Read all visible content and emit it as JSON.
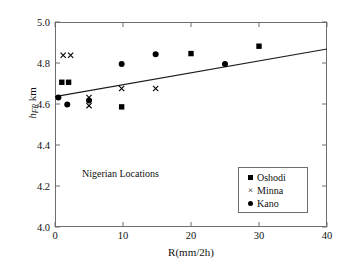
{
  "chart_data": {
    "type": "scatter",
    "title": "",
    "annotation": "Nigerian Locations",
    "xlabel": "R(mm/2h)",
    "ylabel_main": "h",
    "ylabel_sub": "FR",
    "ylabel_unit": " km",
    "xlim": [
      0,
      40
    ],
    "ylim": [
      4.0,
      5.0
    ],
    "xticks": [
      0,
      10,
      20,
      30,
      40
    ],
    "xtick_labels": [
      "0",
      "10",
      "20",
      "30",
      "40"
    ],
    "yticks": [
      4.0,
      4.2,
      4.4,
      4.6,
      4.8,
      5.0
    ],
    "ytick_labels": [
      "4.0",
      "4.2",
      "4.4",
      "4.6",
      "4.8",
      "5.0"
    ],
    "grid": false,
    "legend_position": "lower-right",
    "series": [
      {
        "name": "Oshodi",
        "marker": "square",
        "color": "#000000",
        "points": [
          {
            "x": 1.0,
            "y": 4.706
          },
          {
            "x": 2.0,
            "y": 4.706
          },
          {
            "x": 9.8,
            "y": 4.586
          },
          {
            "x": 20.0,
            "y": 4.846
          },
          {
            "x": 30.0,
            "y": 4.882
          }
        ]
      },
      {
        "name": "Minna",
        "marker": "x",
        "color": "#000000",
        "points": [
          {
            "x": 1.2,
            "y": 4.838
          },
          {
            "x": 2.3,
            "y": 4.838
          },
          {
            "x": 5.0,
            "y": 4.632
          },
          {
            "x": 5.0,
            "y": 4.592
          },
          {
            "x": 9.8,
            "y": 4.676
          },
          {
            "x": 14.8,
            "y": 4.676
          }
        ]
      },
      {
        "name": "Kano",
        "marker": "circle",
        "color": "#000000",
        "points": [
          {
            "x": 0.5,
            "y": 4.632
          },
          {
            "x": 1.8,
            "y": 4.598
          },
          {
            "x": 5.0,
            "y": 4.617
          },
          {
            "x": 9.8,
            "y": 4.795
          },
          {
            "x": 14.8,
            "y": 4.843
          },
          {
            "x": 25.0,
            "y": 4.795
          }
        ]
      }
    ],
    "trendline": {
      "name": "linear-fit",
      "x0": 0.0,
      "y0": 4.636,
      "x1": 40.0,
      "y1": 4.868,
      "color": "#1a1a1a"
    },
    "legend_entries": [
      "Oshodi",
      "Minna",
      "Kano"
    ]
  }
}
